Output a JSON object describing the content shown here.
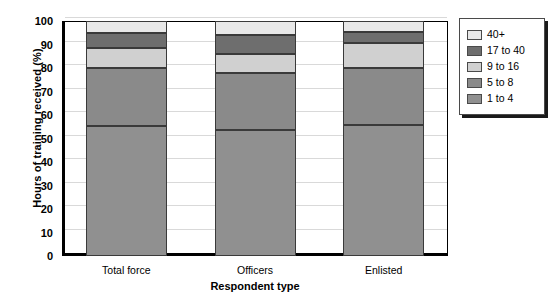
{
  "chart_data": {
    "type": "bar",
    "stacked": true,
    "title": "",
    "xlabel": "Respondent type",
    "ylabel": "Hours of training received (%)",
    "categories": [
      "Total force",
      "Officers",
      "Enlisted"
    ],
    "ylim": [
      0,
      100
    ],
    "yticks": [
      0,
      10,
      20,
      30,
      40,
      50,
      60,
      70,
      80,
      90,
      100
    ],
    "ytick_labels": [
      "0",
      "10",
      "20",
      "30",
      "40",
      "50",
      "60",
      "70",
      "80",
      "90",
      "100"
    ],
    "grid": true,
    "legend_position": "right-outside",
    "series": [
      {
        "name": "1 to 4",
        "color": "#909090",
        "values": [
          55.3,
          53.6,
          55.6
        ]
      },
      {
        "name": "5 to 8",
        "color": "#8a8a8a",
        "values": [
          24.5,
          24.4,
          24.6
        ]
      },
      {
        "name": "9 to 16",
        "color": "#d0d0d0",
        "values": [
          8.9,
          8.0,
          10.3
        ]
      },
      {
        "name": "17 to 40",
        "color": "#6e6e6e",
        "values": [
          6.0,
          8.2,
          4.7
        ]
      },
      {
        "name": "40+",
        "color": "#e8e8e8",
        "values": [
          5.3,
          5.8,
          4.8
        ]
      }
    ],
    "cumulative_tops": {
      "Total force": [
        55.3,
        79.8,
        88.7,
        94.7,
        100.0
      ],
      "Officers": [
        53.6,
        78.0,
        86.0,
        94.2,
        100.0
      ],
      "Enlisted": [
        55.6,
        80.2,
        90.5,
        95.2,
        100.0
      ]
    }
  },
  "legend": {
    "entries": [
      {
        "label": "40+",
        "color": "#e8e8e8"
      },
      {
        "label": "17 to 40",
        "color": "#6e6e6e"
      },
      {
        "label": "9 to 16",
        "color": "#d0d0d0"
      },
      {
        "label": "5 to 8",
        "color": "#8a8a8a"
      },
      {
        "label": "1 to 4",
        "color": "#909090"
      }
    ]
  },
  "axes": {
    "y_title": "Hours of training received (%)",
    "x_title": "Respondent type"
  }
}
